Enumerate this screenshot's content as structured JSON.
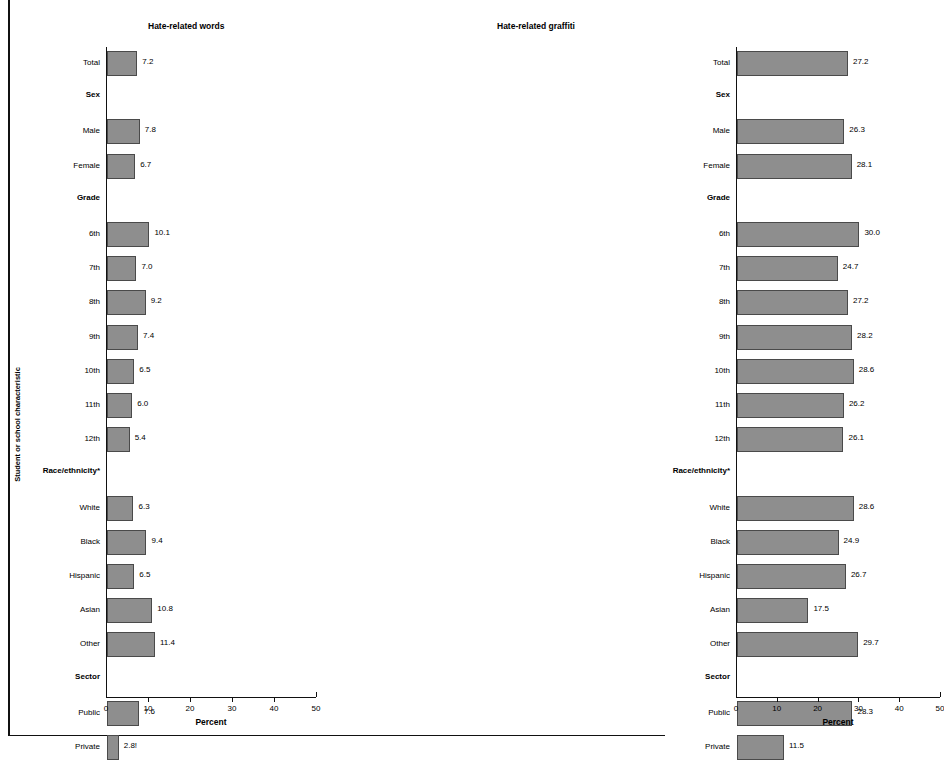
{
  "axis": {
    "y_title": "Student or school characteristic",
    "x_title": "Percent",
    "x_ticks": [
      "0",
      "10",
      "20",
      "30",
      "40",
      "50"
    ]
  },
  "panels": [
    {
      "id": "words",
      "title": "Hate-related words"
    },
    {
      "id": "graffiti",
      "title": "Hate-related graffiti"
    }
  ],
  "chart_data": {
    "type": "bar",
    "title": "",
    "orientation": "horizontal",
    "xlabel": "Percent",
    "ylabel": "Student or school characteristic",
    "xlim": [
      0,
      50
    ],
    "xticks": [
      0,
      10,
      20,
      30,
      40,
      50
    ],
    "grid": false,
    "legend": "none",
    "bar_color": "#8e8e8e",
    "bar_border_color": "#4a4a4a",
    "categories": [
      "Total",
      "Sex",
      "Male",
      "Female",
      "Grade",
      "6th",
      "7th",
      "8th",
      "9th",
      "10th",
      "11th",
      "12th",
      "Race/ethnicity*",
      "White",
      "Black",
      "Hispanic",
      "Asian",
      "Other",
      "Sector",
      "Public",
      "Private"
    ],
    "group_headers": [
      "Sex",
      "Grade",
      "Race/ethnicity*",
      "Sector"
    ],
    "series": [
      {
        "name": "Hate-related words",
        "values": [
          7.2,
          null,
          7.8,
          6.7,
          null,
          10.1,
          7.0,
          9.2,
          7.4,
          6.5,
          6.0,
          5.4,
          null,
          6.3,
          9.4,
          6.5,
          10.8,
          11.4,
          null,
          7.6,
          2.8
        ],
        "labels": [
          "7.2",
          "",
          "7.8",
          "6.7",
          "",
          "10.1",
          "7.0",
          "9.2",
          "7.4",
          "6.5",
          "6.0",
          "5.4",
          "",
          "6.3",
          "9.4",
          "6.5",
          "10.8",
          "11.4",
          "",
          "7.6",
          "2.8!"
        ]
      },
      {
        "name": "Hate-related graffiti",
        "values": [
          27.2,
          null,
          26.3,
          28.1,
          null,
          30.0,
          24.7,
          27.2,
          28.2,
          28.6,
          26.2,
          26.1,
          null,
          28.6,
          24.9,
          26.7,
          17.5,
          29.7,
          null,
          28.3,
          11.5
        ],
        "labels": [
          "27.2",
          "",
          "26.3",
          "28.1",
          "",
          "30.0",
          "24.7",
          "27.2",
          "28.2",
          "28.6",
          "26.2",
          "26.1",
          "",
          "28.6",
          "24.9",
          "26.7",
          "17.5",
          "29.7",
          "",
          "28.3",
          "11.5"
        ]
      }
    ]
  }
}
